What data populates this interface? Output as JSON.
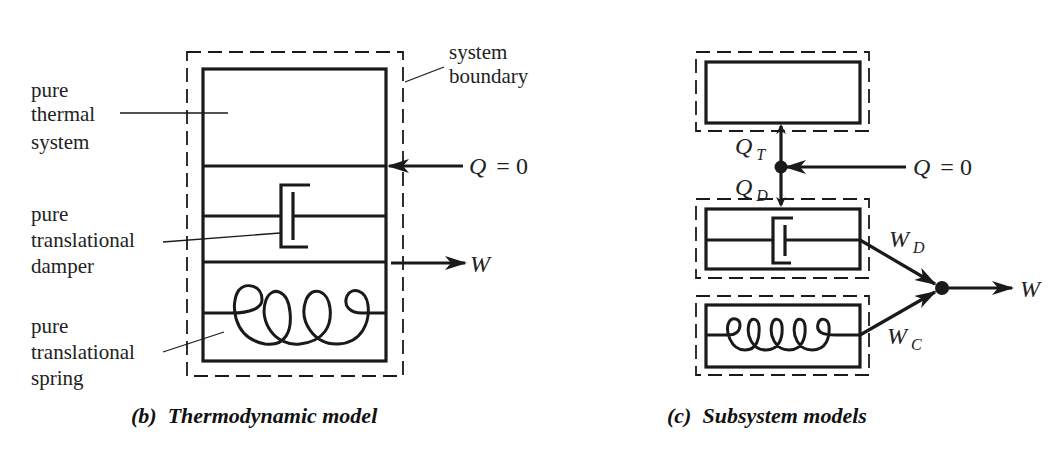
{
  "figure": {
    "panel_b": {
      "caption": "(b)  Thermodynamic model",
      "labels": {
        "thermal": [
          "pure",
          "thermal",
          "system"
        ],
        "damper": [
          "pure",
          "translational",
          "damper"
        ],
        "spring": [
          "pure",
          "translational",
          "spring"
        ],
        "boundary": [
          "system",
          "boundary"
        ]
      },
      "heat_input": {
        "symbol": "Q",
        "equals": "= 0"
      },
      "work_output": {
        "symbol": "W"
      }
    },
    "panel_c": {
      "caption": "(c)  Subsystem models",
      "heat_input": {
        "symbol": "Q",
        "equals": "= 0"
      },
      "heat_thermal": {
        "symbol": "Q",
        "subscript": "T"
      },
      "heat_damper": {
        "symbol": "Q",
        "subscript": "D"
      },
      "work_damper": {
        "symbol": "W",
        "subscript": "D"
      },
      "work_spring": {
        "symbol": "W",
        "subscript": "C"
      },
      "work_output": {
        "symbol": "W"
      }
    },
    "colors": {
      "ink": "#1a1a1a",
      "background": "#ffffff"
    }
  }
}
